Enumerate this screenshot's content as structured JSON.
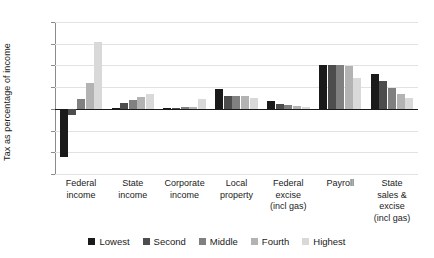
{
  "chart_data": {
    "type": "bar",
    "title": "",
    "subtitle": "",
    "xlabel": "",
    "ylabel": "Tax as percentage of income",
    "ylim": [
      -15,
      20
    ],
    "yticks": [
      20,
      15,
      10,
      5,
      0,
      -5,
      -10,
      -15
    ],
    "ytick_labels": [
      "20",
      "15",
      "10",
      "5",
      "0",
      "−5",
      "−10",
      "−15"
    ],
    "grid": true,
    "legend_position": "bottom",
    "categories": [
      "Federal income",
      "State income",
      "Corporate income",
      "Local property",
      "Federal excise (incl gas)",
      "Payroll",
      "State sales & excise (incl gas)"
    ],
    "category_lines": [
      [
        "Federal",
        "income"
      ],
      [
        "State",
        "income"
      ],
      [
        "Corporate",
        "income"
      ],
      [
        "Local",
        "property"
      ],
      [
        "Federal",
        "excise",
        "(incl gas)"
      ],
      [
        "Payroll"
      ],
      [
        "State",
        "sales &",
        "excise",
        "(incl gas)"
      ]
    ],
    "series": [
      {
        "name": "Lowest",
        "color": "#1a1a1a",
        "values": [
          -11.0,
          0.2,
          0.3,
          4.5,
          1.8,
          10.0,
          8.0
        ]
      },
      {
        "name": "Second",
        "color": "#4d4d4d",
        "values": [
          -1.5,
          1.3,
          0.3,
          3.0,
          1.2,
          10.0,
          6.3
        ]
      },
      {
        "name": "Middle",
        "color": "#808080",
        "values": [
          2.3,
          2.0,
          0.4,
          3.0,
          0.9,
          10.0,
          4.7
        ]
      },
      {
        "name": "Fourth",
        "color": "#b3b3b3",
        "values": [
          6.0,
          2.7,
          0.5,
          3.0,
          0.7,
          9.9,
          3.5
        ]
      },
      {
        "name": "Highest",
        "color": "#d9d9d9",
        "values": [
          15.3,
          3.4,
          2.2,
          2.6,
          0.4,
          7.2,
          2.5
        ]
      }
    ]
  }
}
